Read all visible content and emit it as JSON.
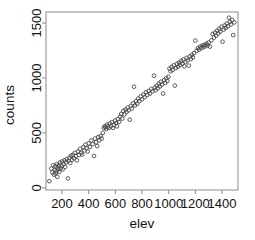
{
  "chart_data": {
    "type": "scatter",
    "title": "",
    "xlabel": "elev",
    "ylabel": "counts",
    "xlim": [
      80,
      1520
    ],
    "ylim": [
      -20,
      1600
    ],
    "xticks": [
      200,
      400,
      600,
      800,
      1000,
      1200,
      1400
    ],
    "xtick_labels": [
      "200",
      "400",
      "600",
      "800",
      "1000",
      "1200",
      "1400"
    ],
    "yticks": [
      0,
      500,
      1000,
      1500
    ],
    "ytick_labels": [
      "0",
      "500",
      "1000",
      "1500"
    ],
    "grid": false,
    "legend": null,
    "marker": "open-circle",
    "marker_color": "#4a4a4a",
    "frame_color": "#8a8a8a",
    "background": "#ffffff",
    "points": [
      [
        105,
        60
      ],
      [
        120,
        175
      ],
      [
        128,
        140
      ],
      [
        134,
        205
      ],
      [
        140,
        120
      ],
      [
        145,
        160
      ],
      [
        150,
        195
      ],
      [
        152,
        130
      ],
      [
        158,
        150
      ],
      [
        160,
        215
      ],
      [
        165,
        100
      ],
      [
        168,
        185
      ],
      [
        172,
        168
      ],
      [
        176,
        205
      ],
      [
        180,
        145
      ],
      [
        185,
        230
      ],
      [
        190,
        175
      ],
      [
        196,
        200
      ],
      [
        200,
        240
      ],
      [
        205,
        168
      ],
      [
        212,
        215
      ],
      [
        218,
        250
      ],
      [
        224,
        190
      ],
      [
        230,
        232
      ],
      [
        236,
        262
      ],
      [
        244,
        85
      ],
      [
        248,
        245
      ],
      [
        256,
        275
      ],
      [
        262,
        225
      ],
      [
        268,
        292
      ],
      [
        275,
        255
      ],
      [
        282,
        300
      ],
      [
        290,
        268
      ],
      [
        296,
        318
      ],
      [
        304,
        288
      ],
      [
        312,
        250
      ],
      [
        320,
        330
      ],
      [
        328,
        300
      ],
      [
        336,
        355
      ],
      [
        344,
        318
      ],
      [
        352,
        302
      ],
      [
        360,
        370
      ],
      [
        368,
        340
      ],
      [
        376,
        392
      ],
      [
        384,
        360
      ],
      [
        392,
        330
      ],
      [
        400,
        405
      ],
      [
        410,
        372
      ],
      [
        420,
        430
      ],
      [
        430,
        398
      ],
      [
        440,
        290
      ],
      [
        448,
        448
      ],
      [
        456,
        415
      ],
      [
        464,
        380
      ],
      [
        472,
        462
      ],
      [
        480,
        432
      ],
      [
        490,
        470
      ],
      [
        498,
        448
      ],
      [
        506,
        500
      ],
      [
        514,
        545
      ],
      [
        520,
        560
      ],
      [
        526,
        552
      ],
      [
        532,
        535
      ],
      [
        538,
        575
      ],
      [
        544,
        558
      ],
      [
        550,
        545
      ],
      [
        558,
        585
      ],
      [
        566,
        560
      ],
      [
        574,
        598
      ],
      [
        582,
        545
      ],
      [
        590,
        572
      ],
      [
        598,
        612
      ],
      [
        606,
        590
      ],
      [
        612,
        560
      ],
      [
        620,
        625
      ],
      [
        628,
        600
      ],
      [
        636,
        648
      ],
      [
        644,
        672
      ],
      [
        652,
        630
      ],
      [
        660,
        700
      ],
      [
        668,
        668
      ],
      [
        676,
        712
      ],
      [
        684,
        690
      ],
      [
        692,
        730
      ],
      [
        700,
        705
      ],
      [
        708,
        620
      ],
      [
        716,
        745
      ],
      [
        724,
        722
      ],
      [
        732,
        768
      ],
      [
        740,
        920
      ],
      [
        748,
        750
      ],
      [
        756,
        790
      ],
      [
        764,
        765
      ],
      [
        772,
        812
      ],
      [
        780,
        788
      ],
      [
        790,
        832
      ],
      [
        800,
        805
      ],
      [
        810,
        848
      ],
      [
        820,
        825
      ],
      [
        830,
        870
      ],
      [
        840,
        845
      ],
      [
        850,
        882
      ],
      [
        860,
        858
      ],
      [
        870,
        900
      ],
      [
        880,
        878
      ],
      [
        890,
        1020
      ],
      [
        896,
        912
      ],
      [
        902,
        888
      ],
      [
        910,
        930
      ],
      [
        918,
        905
      ],
      [
        926,
        948
      ],
      [
        934,
        922
      ],
      [
        942,
        965
      ],
      [
        950,
        940
      ],
      [
        958,
        858
      ],
      [
        966,
        980
      ],
      [
        974,
        955
      ],
      [
        982,
        998
      ],
      [
        990,
        972
      ],
      [
        998,
        1010
      ],
      [
        1006,
        1085
      ],
      [
        1014,
        1060
      ],
      [
        1022,
        1100
      ],
      [
        1030,
        1072
      ],
      [
        1038,
        1115
      ],
      [
        1046,
        930
      ],
      [
        1054,
        1090
      ],
      [
        1062,
        1128
      ],
      [
        1070,
        1102
      ],
      [
        1078,
        1140
      ],
      [
        1086,
        1118
      ],
      [
        1094,
        1155
      ],
      [
        1102,
        1130
      ],
      [
        1110,
        1168
      ],
      [
        1118,
        1105
      ],
      [
        1126,
        1145
      ],
      [
        1134,
        1182
      ],
      [
        1142,
        1160
      ],
      [
        1150,
        1112
      ],
      [
        1158,
        1195
      ],
      [
        1166,
        1172
      ],
      [
        1174,
        1210
      ],
      [
        1182,
        1188
      ],
      [
        1190,
        1225
      ],
      [
        1200,
        1340
      ],
      [
        1210,
        1248
      ],
      [
        1220,
        1272
      ],
      [
        1228,
        1258
      ],
      [
        1236,
        1285
      ],
      [
        1244,
        1270
      ],
      [
        1252,
        1295
      ],
      [
        1260,
        1280
      ],
      [
        1268,
        1302
      ],
      [
        1276,
        1288
      ],
      [
        1284,
        1312
      ],
      [
        1292,
        1298
      ],
      [
        1300,
        1322
      ],
      [
        1310,
        1285
      ],
      [
        1320,
        1342
      ],
      [
        1330,
        1400
      ],
      [
        1340,
        1368
      ],
      [
        1348,
        1412
      ],
      [
        1356,
        1385
      ],
      [
        1364,
        1430
      ],
      [
        1372,
        1405
      ],
      [
        1380,
        1448
      ],
      [
        1388,
        1422
      ],
      [
        1396,
        1465
      ],
      [
        1404,
        1330
      ],
      [
        1412,
        1440
      ],
      [
        1420,
        1478
      ],
      [
        1428,
        1455
      ],
      [
        1436,
        1495
      ],
      [
        1444,
        1470
      ],
      [
        1452,
        1548
      ],
      [
        1460,
        1510
      ],
      [
        1468,
        1488
      ],
      [
        1476,
        1528
      ],
      [
        1484,
        1390
      ],
      [
        1492,
        1505
      ]
    ]
  }
}
